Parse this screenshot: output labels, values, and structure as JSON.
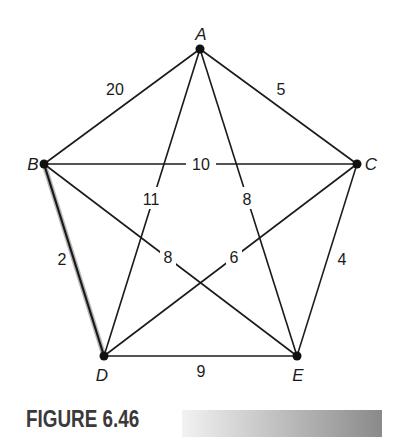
{
  "figure": {
    "caption": "FIGURE 6.46"
  },
  "graph": {
    "nodes": [
      {
        "id": "A",
        "label": "A",
        "x": 200,
        "y": 49
      },
      {
        "id": "B",
        "label": "B",
        "x": 44,
        "y": 164
      },
      {
        "id": "C",
        "label": "C",
        "x": 357,
        "y": 164
      },
      {
        "id": "D",
        "label": "D",
        "x": 104,
        "y": 356
      },
      {
        "id": "E",
        "label": "E",
        "x": 297,
        "y": 356
      }
    ],
    "edges": [
      {
        "from": "A",
        "to": "B",
        "weight": "20",
        "highlighted": false
      },
      {
        "from": "A",
        "to": "C",
        "weight": "5",
        "highlighted": false
      },
      {
        "from": "B",
        "to": "C",
        "weight": "10",
        "highlighted": false
      },
      {
        "from": "A",
        "to": "D",
        "weight": "11",
        "highlighted": false
      },
      {
        "from": "A",
        "to": "E",
        "weight": "8",
        "highlighted": false
      },
      {
        "from": "B",
        "to": "E",
        "weight": "8",
        "highlighted": false
      },
      {
        "from": "C",
        "to": "D",
        "weight": "6",
        "highlighted": false
      },
      {
        "from": "B",
        "to": "D",
        "weight": "2",
        "highlighted": true
      },
      {
        "from": "C",
        "to": "E",
        "weight": "4",
        "highlighted": false
      },
      {
        "from": "D",
        "to": "E",
        "weight": "9",
        "highlighted": false
      }
    ]
  }
}
